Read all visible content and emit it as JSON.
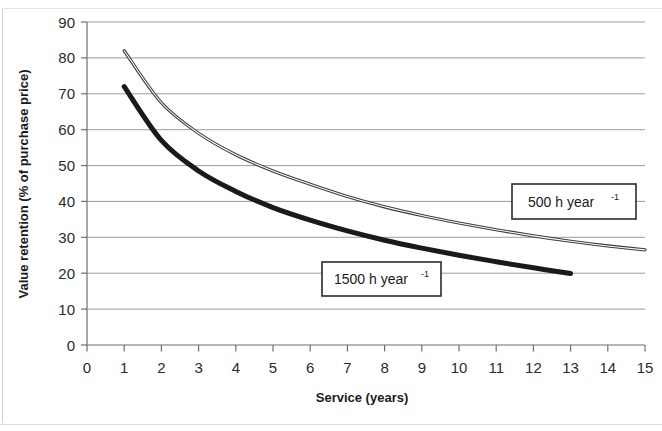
{
  "chart_data": {
    "type": "line",
    "title": "",
    "xlabel": "Service (years)",
    "ylabel": "Value retention (% of purchase price)",
    "xlim": [
      0,
      15
    ],
    "ylim": [
      0,
      90
    ],
    "xticks": [
      "0",
      "1",
      "2",
      "3",
      "4",
      "5",
      "6",
      "7",
      "8",
      "9",
      "10",
      "11",
      "12",
      "13",
      "14",
      "15"
    ],
    "yticks": [
      "0",
      "10",
      "20",
      "30",
      "40",
      "50",
      "60",
      "70",
      "80",
      "90"
    ],
    "grid": "horizontal",
    "legend_position": "inline-callout-boxes",
    "series": [
      {
        "name": "500 h year",
        "name_exponent": "-1",
        "label": "500 h year-1",
        "style": "thin-double-line",
        "color": "#3b3b3b",
        "x": [
          1,
          2,
          3,
          4,
          5,
          6,
          7,
          8,
          9,
          10,
          11,
          12,
          13,
          14,
          15
        ],
        "values": [
          82,
          67.5,
          59,
          53,
          48.5,
          44.8,
          41.4,
          38.5,
          36.1,
          34.0,
          32.1,
          30.4,
          28.9,
          27.6,
          26.5
        ]
      },
      {
        "name": "1500 h year",
        "name_exponent": "-1",
        "label": "1500 h year-1",
        "style": "thick-line",
        "color": "#1a1a1a",
        "x": [
          1,
          2,
          3,
          4,
          5,
          6,
          7,
          8,
          9,
          10,
          11,
          12,
          13
        ],
        "values": [
          72,
          57,
          48.5,
          42.8,
          38.3,
          34.8,
          31.8,
          29.2,
          27.0,
          25.0,
          23.2,
          21.5,
          19.9
        ]
      }
    ],
    "annotations": [
      {
        "id": "callout-500",
        "text": "500 h year",
        "exponent": "-1",
        "box": true
      },
      {
        "id": "callout-1500",
        "text": "1500 h year",
        "exponent": "-1",
        "box": true
      }
    ]
  },
  "axes": {
    "x_title": "Service (years)",
    "y_title": "Value retention (% of purchase price)"
  }
}
